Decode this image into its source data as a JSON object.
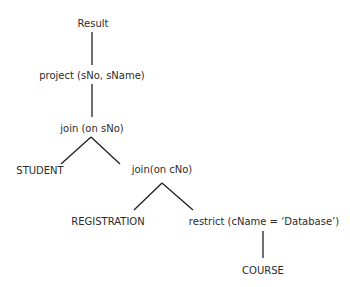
{
  "diagram": {
    "type": "query-tree",
    "colors": {
      "text": "#2b2b2b",
      "edge": "#1f1f1f",
      "background": "#ffffff"
    },
    "nodes": [
      {
        "id": "result",
        "label": "Result"
      },
      {
        "id": "project",
        "label": "project (sNo, sName)"
      },
      {
        "id": "join_sno",
        "label": "join (on sNo)"
      },
      {
        "id": "student",
        "label": "STUDENT"
      },
      {
        "id": "join_cno",
        "label": "join(on cNo)"
      },
      {
        "id": "registration",
        "label": "REGISTRATION"
      },
      {
        "id": "restrict",
        "label": "restrict (cName = ‘Database’)"
      },
      {
        "id": "course",
        "label": "COURSE"
      }
    ],
    "edges": [
      {
        "from": "result",
        "to": "project"
      },
      {
        "from": "project",
        "to": "join_sno"
      },
      {
        "from": "join_sno",
        "to": "student"
      },
      {
        "from": "join_sno",
        "to": "join_cno"
      },
      {
        "from": "join_cno",
        "to": "registration"
      },
      {
        "from": "join_cno",
        "to": "restrict"
      },
      {
        "from": "restrict",
        "to": "course"
      }
    ]
  }
}
